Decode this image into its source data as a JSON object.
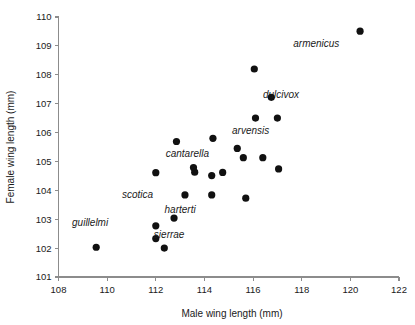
{
  "chart_data": {
    "type": "scatter",
    "title": "",
    "xlabel": "Male wing length (mm)",
    "ylabel": "Female wing length (mm)",
    "xlim": [
      108,
      122
    ],
    "ylim": [
      101,
      110
    ],
    "xticks": [
      108,
      110,
      112,
      114,
      116,
      118,
      120,
      122
    ],
    "yticks": [
      101,
      102,
      103,
      104,
      105,
      106,
      107,
      108,
      109,
      110
    ],
    "grid": false,
    "legend": "none",
    "marker_color": "#111111",
    "axis_color": "#8c8c8c",
    "points": [
      {
        "x": 109.55,
        "y": 102.03
      },
      {
        "x": 112.0,
        "y": 102.77
      },
      {
        "x": 112.0,
        "y": 102.33
      },
      {
        "x": 112.35,
        "y": 102.0
      },
      {
        "x": 112.0,
        "y": 104.61
      },
      {
        "x": 112.75,
        "y": 103.04
      },
      {
        "x": 112.85,
        "y": 105.69
      },
      {
        "x": 113.2,
        "y": 103.84
      },
      {
        "x": 113.55,
        "y": 104.79
      },
      {
        "x": 113.6,
        "y": 104.63
      },
      {
        "x": 114.3,
        "y": 104.51
      },
      {
        "x": 114.3,
        "y": 103.84
      },
      {
        "x": 114.35,
        "y": 105.8
      },
      {
        "x": 114.75,
        "y": 104.62
      },
      {
        "x": 115.35,
        "y": 105.45
      },
      {
        "x": 115.6,
        "y": 105.13
      },
      {
        "x": 115.7,
        "y": 103.73
      },
      {
        "x": 116.05,
        "y": 108.2
      },
      {
        "x": 116.1,
        "y": 106.5
      },
      {
        "x": 116.4,
        "y": 105.13
      },
      {
        "x": 116.75,
        "y": 107.22
      },
      {
        "x": 117.0,
        "y": 106.5
      },
      {
        "x": 117.05,
        "y": 104.74
      },
      {
        "x": 120.4,
        "y": 109.51
      }
    ],
    "annotations": [
      {
        "text": "armenicus",
        "x": 118.6,
        "y": 108.95
      },
      {
        "text": "dulcivox",
        "x": 117.15,
        "y": 107.2
      },
      {
        "text": "arvensis",
        "x": 115.9,
        "y": 105.95
      },
      {
        "text": "cantarella",
        "x": 113.3,
        "y": 105.15
      },
      {
        "text": "scotica",
        "x": 111.25,
        "y": 103.75
      },
      {
        "text": "harterti",
        "x": 113.0,
        "y": 103.2
      },
      {
        "text": "sierrae",
        "x": 112.55,
        "y": 102.35
      },
      {
        "text": "guillelmi",
        "x": 109.3,
        "y": 102.75
      }
    ]
  }
}
